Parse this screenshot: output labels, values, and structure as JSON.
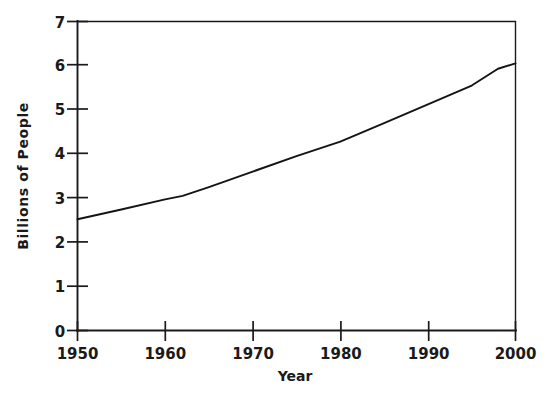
{
  "figure": {
    "background_color": "#ffffff",
    "ink_color": "#1a1a1a"
  },
  "chart_data": {
    "type": "line",
    "title": "",
    "xlabel": "Year",
    "ylabel": "Billions of People",
    "xlim": [
      1950,
      2000
    ],
    "ylim": [
      0,
      7
    ],
    "xticks": [
      1950,
      1960,
      1970,
      1980,
      1990,
      2000
    ],
    "xticklabels": [
      "1950",
      "1960",
      "1970",
      "1980",
      "1990",
      "2000"
    ],
    "yticks": [
      0,
      1,
      2,
      3,
      4,
      5,
      6,
      7
    ],
    "yticklabels": [
      "0",
      "1",
      "2",
      "3",
      "4",
      "5",
      "6",
      "7"
    ],
    "grid": false,
    "legend": false,
    "legend_position": "none",
    "frame": "box",
    "series": [
      {
        "name": "World Population",
        "x": [
          1950,
          1955,
          1960,
          1962,
          1965,
          1970,
          1975,
          1980,
          1985,
          1990,
          1995,
          1998,
          2000
        ],
        "values": [
          2.52,
          2.74,
          2.97,
          3.05,
          3.25,
          3.6,
          3.95,
          4.28,
          4.7,
          5.12,
          5.55,
          5.93,
          6.05
        ]
      }
    ],
    "annotations": []
  },
  "axis_labels": {
    "x_title": "Year",
    "y_title": "Billions of People"
  }
}
